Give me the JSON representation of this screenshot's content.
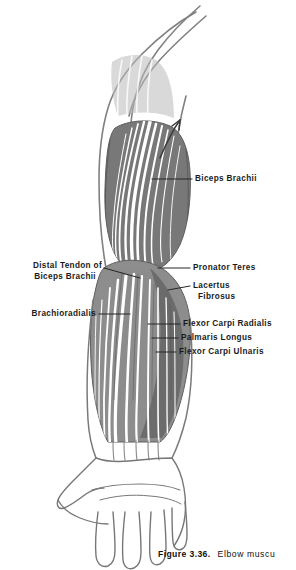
{
  "figure": {
    "caption_number": "Figure 3.36.",
    "caption_text": "Elbow muscu"
  },
  "colors": {
    "ink": "#1a1a1a",
    "outline": "#808080",
    "muscle_dark": "#707070",
    "muscle_mid": "#909090",
    "muscle_light": "#b8b8b8",
    "striation": "#ffffff",
    "leader": "#2a2a2a",
    "background": "#ffffff"
  },
  "labels": {
    "biceps_brachii": {
      "text": "Biceps Brachii",
      "side": "right"
    },
    "pronator_teres": {
      "text": "Pronator Teres",
      "side": "right"
    },
    "lacertus_fibrosus": {
      "line1": "Lacertus",
      "line2": "Fibrosus",
      "side": "right"
    },
    "flexor_carpi_radialis": {
      "text": "Flexor Carpi Radialis",
      "side": "right"
    },
    "palmaris_longus": {
      "text": "Palmaris Longus",
      "side": "right"
    },
    "flexor_carpi_ulnaris": {
      "text": "Flexor Carpi Ulnaris",
      "side": "right"
    },
    "distal_tendon_biceps": {
      "line1": "Distal Tendon of",
      "line2": "Biceps Brachii",
      "side": "left"
    },
    "brachioradialis": {
      "text": "Brachioradialis",
      "side": "left"
    }
  }
}
